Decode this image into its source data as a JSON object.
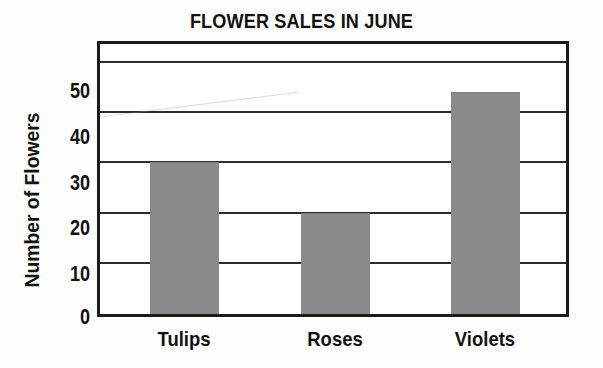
{
  "chart_data": {
    "type": "bar",
    "title": "FLOWER SALES IN JUNE",
    "xlabel": "",
    "ylabel": "Number of Flowers",
    "categories": [
      "Tulips",
      "Roses",
      "Violets"
    ],
    "values": [
      30,
      20,
      44
    ],
    "ylim": [
      0,
      55
    ],
    "yticks": [
      0,
      10,
      20,
      30,
      40,
      50
    ],
    "ytick_labels": [
      "0",
      "10",
      "20",
      "30",
      "40",
      "50"
    ],
    "grid": "horizontal",
    "legend": "none",
    "series": [
      {
        "name": "Number of Flowers",
        "values": [
          30,
          20,
          44
        ]
      }
    ],
    "colors": {
      "bar_fill": "#8a8a8a",
      "axis": "#1b1b1b",
      "gridline": "#2b2b2b",
      "text": "#121212",
      "background": "#fdfdfc"
    }
  }
}
